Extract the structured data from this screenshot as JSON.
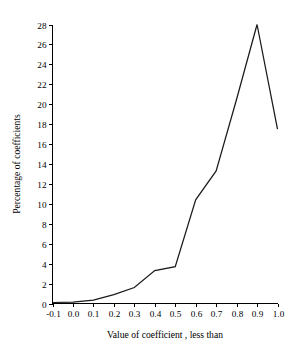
{
  "chart_data": {
    "type": "line",
    "title": "",
    "xlabel": "Value of coefficient , less than",
    "ylabel": "Percentage of coefficients",
    "x": [
      -0.1,
      0.0,
      0.1,
      0.2,
      0.3,
      0.4,
      0.5,
      0.6,
      0.7,
      0.8,
      0.9,
      1.0
    ],
    "values": [
      0.1,
      0.15,
      0.35,
      0.9,
      1.6,
      3.3,
      3.7,
      10.4,
      13.3,
      20.5,
      28.0,
      17.5
    ],
    "xlim": [
      -0.1,
      1.0
    ],
    "ylim": [
      0,
      28
    ],
    "xticks": [
      -0.1,
      0.0,
      0.1,
      0.2,
      0.3,
      0.4,
      0.5,
      0.6,
      0.7,
      0.8,
      0.9,
      1.0
    ],
    "xtick_labels": [
      "-0.1",
      "0.0",
      "0.1",
      "0.2",
      "0.3",
      "0.4",
      "0.5",
      "0.6",
      "0.7",
      "0.8",
      "0.9",
      "1.0"
    ],
    "yticks": [
      0,
      2,
      4,
      6,
      8,
      10,
      12,
      14,
      16,
      18,
      20,
      22,
      24,
      26,
      28
    ],
    "ytick_labels": [
      "0",
      "2",
      "4",
      "6",
      "8",
      "10",
      "12",
      "14",
      "16",
      "18",
      "20",
      "22",
      "24",
      "26",
      "28"
    ],
    "grid": false,
    "legend": false,
    "line_color": "#1a1a1a",
    "background_color": "#ffffff"
  },
  "axes": {
    "x_title": "Value of coefficient , less than",
    "y_title": "Percentage of coefficients"
  }
}
